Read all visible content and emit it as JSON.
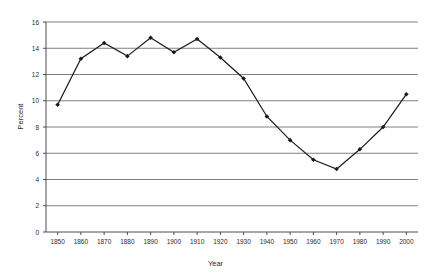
{
  "chart_data": {
    "type": "line",
    "title": "",
    "xlabel": "Year",
    "ylabel": "Percent",
    "xlim": [
      1845,
      2005
    ],
    "ylim": [
      0,
      16
    ],
    "grid": "horizontal",
    "legend": "none",
    "marker": "filled-diamond",
    "line_color": "#1a1a1a",
    "grid_color": "#808080",
    "axis_color": "#4d4d4d",
    "background_color": "#ffffff",
    "x": [
      1850,
      1860,
      1870,
      1880,
      1890,
      1900,
      1910,
      1920,
      1930,
      1940,
      1950,
      1960,
      1970,
      1980,
      1990,
      2000
    ],
    "values": [
      9.7,
      13.2,
      14.4,
      13.4,
      14.8,
      13.7,
      14.7,
      13.3,
      11.7,
      8.8,
      7.0,
      5.5,
      4.8,
      6.3,
      8.0,
      10.5
    ],
    "series": [
      {
        "name": "Percent foreign born",
        "values": [
          9.7,
          13.2,
          14.4,
          13.4,
          14.8,
          13.7,
          14.7,
          13.3,
          11.7,
          8.8,
          7.0,
          5.5,
          4.8,
          6.3,
          8.0,
          10.5
        ]
      }
    ],
    "yticks": [
      0,
      2,
      4,
      6,
      8,
      10,
      12,
      14,
      16
    ],
    "ytick_labels": [
      "0",
      "2",
      "4",
      "6",
      "8",
      "10",
      "12",
      "14",
      "16"
    ],
    "xticks": [
      1850,
      1860,
      1870,
      1880,
      1890,
      1900,
      1910,
      1920,
      1930,
      1940,
      1950,
      1960,
      1970,
      1980,
      1990,
      2000
    ],
    "xtick_labels": [
      "1850",
      "1860",
      "1870",
      "1880",
      "1890",
      "1900",
      "1910",
      "1920",
      "1930",
      "1940",
      "1950",
      "1960",
      "1970",
      "1980",
      "1990",
      "2000"
    ]
  }
}
